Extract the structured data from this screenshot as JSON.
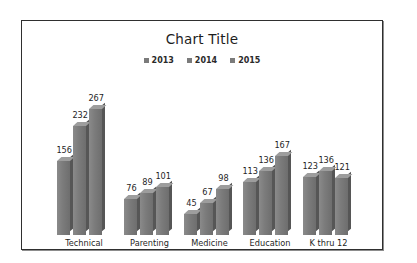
{
  "chart_data": {
    "type": "bar",
    "title": "Chart Title",
    "xlabel": "",
    "ylabel": "",
    "grid": false,
    "legend_position": "top",
    "ylim": [
      0,
      280
    ],
    "categories": [
      "Technical",
      "Parenting",
      "Medicine",
      "Education",
      "K thru 12"
    ],
    "series": [
      {
        "name": "2013",
        "values": [
          156,
          76,
          45,
          113,
          123
        ],
        "color": "#7b7b7b"
      },
      {
        "name": "2014",
        "values": [
          232,
          89,
          67,
          136,
          136
        ],
        "color": "#7b7b7b"
      },
      {
        "name": "2015",
        "values": [
          267,
          101,
          98,
          167,
          121
        ],
        "color": "#7b7b7b"
      }
    ],
    "data_labels_shown": true
  },
  "frame": {
    "border_color": "#2f2f2f",
    "background": "#ffffff"
  }
}
